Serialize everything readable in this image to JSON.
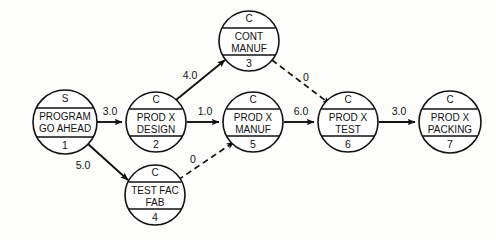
{
  "diagram": {
    "kind": "project-network-diagram",
    "title": "",
    "background_color": "#fdfdfb",
    "line_color": "#111111",
    "node_fill": "#ffffff",
    "nodes": [
      {
        "id": "1",
        "type": "S",
        "label_line1": "PROGRAM",
        "label_line2": "GO AHEAD",
        "cx": 65,
        "cy": 122,
        "r": 32
      },
      {
        "id": "2",
        "type": "C",
        "label_line1": "PROD X",
        "label_line2": "DESIGN",
        "cx": 156,
        "cy": 122,
        "r": 30
      },
      {
        "id": "3",
        "type": "C",
        "label_line1": "CONT",
        "label_line2": "MANUF",
        "cx": 249,
        "cy": 41,
        "r": 30
      },
      {
        "id": "4",
        "type": "C",
        "label_line1": "TEST FAC",
        "label_line2": "FAB",
        "cx": 155,
        "cy": 195,
        "r": 30
      },
      {
        "id": "5",
        "type": "C",
        "label_line1": "PROD X",
        "label_line2": "MANUF",
        "cx": 253,
        "cy": 122,
        "r": 30
      },
      {
        "id": "6",
        "type": "C",
        "label_line1": "PROD X",
        "label_line2": "TEST",
        "cx": 348,
        "cy": 122,
        "r": 30
      },
      {
        "id": "7",
        "type": "C",
        "label_line1": "PROD X",
        "label_line2": "PACKING",
        "cx": 450,
        "cy": 122,
        "r": 31
      }
    ],
    "edges": [
      {
        "from": "1",
        "to": "2",
        "label": "3.0",
        "style": "solid",
        "label_x": 110,
        "label_y": 112
      },
      {
        "from": "1",
        "to": "4",
        "label": "5.0",
        "style": "solid",
        "label_x": 83,
        "label_y": 166
      },
      {
        "from": "2",
        "to": "3",
        "label": "4.0",
        "style": "solid",
        "label_x": 190,
        "label_y": 76
      },
      {
        "from": "2",
        "to": "5",
        "label": "1.0",
        "style": "solid",
        "label_x": 205,
        "label_y": 112
      },
      {
        "from": "3",
        "to": "6",
        "label": "0",
        "style": "dashed",
        "label_x": 306,
        "label_y": 78
      },
      {
        "from": "4",
        "to": "5",
        "label": "0",
        "style": "dashed",
        "label_x": 193,
        "label_y": 160
      },
      {
        "from": "5",
        "to": "6",
        "label": "6.0",
        "style": "solid",
        "label_x": 301,
        "label_y": 112
      },
      {
        "from": "6",
        "to": "7",
        "label": "3.0",
        "style": "solid",
        "label_x": 399,
        "label_y": 112
      }
    ]
  }
}
